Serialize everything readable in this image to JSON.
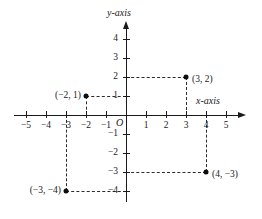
{
  "chart_data": {
    "type": "scatter",
    "title": "",
    "xlabel": "x-axis",
    "ylabel": "y-axis",
    "origin_label": "O",
    "xlim": [
      -5.6,
      5.6
    ],
    "ylim": [
      -4.6,
      4.6
    ],
    "grid": false,
    "legend": "none",
    "x_ticks": [
      {
        "value": -5,
        "label": "−5"
      },
      {
        "value": -4,
        "label": "−4"
      },
      {
        "value": -3,
        "label": "−3"
      },
      {
        "value": -2,
        "label": "−2"
      },
      {
        "value": -1,
        "label": "−1"
      },
      {
        "value": 1,
        "label": "1"
      },
      {
        "value": 2,
        "label": "2"
      },
      {
        "value": 3,
        "label": "3"
      },
      {
        "value": 4,
        "label": "4"
      },
      {
        "value": 5,
        "label": "5"
      }
    ],
    "y_ticks": [
      {
        "value": 4,
        "label": "4"
      },
      {
        "value": 3,
        "label": "3"
      },
      {
        "value": 2,
        "label": "2"
      },
      {
        "value": 1,
        "label": "1"
      },
      {
        "value": -1,
        "label": "−1"
      },
      {
        "value": -2,
        "label": "−2"
      },
      {
        "value": -3,
        "label": "−3"
      },
      {
        "value": -4,
        "label": "−4"
      }
    ],
    "points": [
      {
        "x": 3,
        "y": 2,
        "label": "(3, 2)",
        "label_side": "right"
      },
      {
        "x": -2,
        "y": 1,
        "label": "(−2, 1)",
        "label_side": "left"
      },
      {
        "x": -3,
        "y": -4,
        "label": "(−3, −4)",
        "label_side": "left"
      },
      {
        "x": 4,
        "y": -3,
        "label": "(4, −3)",
        "label_side": "right"
      }
    ],
    "guide_lines": [
      {
        "type": "horizontal",
        "y": 2,
        "from_x": 0,
        "to_x": 3
      },
      {
        "type": "vertical",
        "x": 3,
        "from_y": 0,
        "to_y": 2
      },
      {
        "type": "horizontal",
        "y": 1,
        "from_x": -2,
        "to_x": 0
      },
      {
        "type": "vertical",
        "x": -2,
        "from_y": 0,
        "to_y": 1
      },
      {
        "type": "horizontal",
        "y": -4,
        "from_x": -3,
        "to_x": 0
      },
      {
        "type": "vertical",
        "x": -3,
        "from_y": -4,
        "to_y": 0
      },
      {
        "type": "horizontal",
        "y": -3,
        "from_x": 0,
        "to_x": 4
      },
      {
        "type": "vertical",
        "x": 4,
        "from_y": -3,
        "to_y": 0
      }
    ]
  }
}
